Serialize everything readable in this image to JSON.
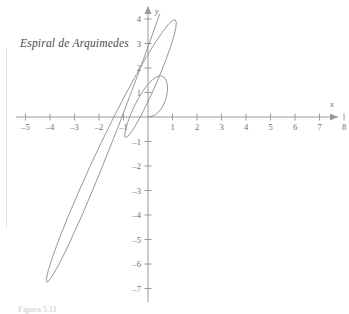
{
  "figure": {
    "title": "Espiral de Arquimedes",
    "caption": "Figura 5.11",
    "background_color": "#ffffff",
    "curve_color": "#8c8c8c",
    "axis_color": "#9a9a9a",
    "label_color": "#6d6d6d",
    "title_color": "#4a4a4a"
  },
  "chart_data": {
    "type": "line",
    "title": "Espiral de Arquimedes",
    "xlabel": "x",
    "ylabel": "y",
    "xlim": [
      -5,
      8
    ],
    "ylim": [
      -7,
      4
    ],
    "grid": false,
    "legend": null,
    "equation": "r = theta",
    "theta_range": [
      0,
      6.283185307179586
    ],
    "x_ticks": [
      -5,
      -4,
      -3,
      -2,
      -1,
      1,
      2,
      3,
      4,
      5,
      6,
      7,
      8
    ],
    "x_tick_labels": [
      "–5",
      "–4",
      "–3",
      "–2",
      "–1",
      "1",
      "2",
      "3",
      "4",
      "5",
      "6",
      "7",
      "8"
    ],
    "y_ticks": [
      4,
      3,
      2,
      1,
      -1,
      -2,
      -3,
      -4,
      -5,
      -6,
      -7
    ],
    "y_tick_labels": [
      "4",
      "3",
      "2",
      "1",
      "–1",
      "–2",
      "–3",
      "–4",
      "–5",
      "–6",
      "–7"
    ],
    "origin_px": [
      148,
      117
    ],
    "unit_px": 24.5,
    "series": [
      {
        "name": "r = theta",
        "points": [
          [
            0.0,
            0.0
          ],
          [
            0.1545,
            0.0245
          ],
          [
            0.3033,
            0.0969
          ],
          [
            0.4405,
            0.2139
          ],
          [
            0.5611,
            0.3696
          ],
          [
            0.6604,
            0.5554
          ],
          [
            0.7346,
            0.7604
          ],
          [
            0.7808,
            0.9721
          ],
          [
            0.797,
            1.1771
          ],
          [
            0.7822,
            1.3619
          ],
          [
            0.7365,
            1.5136
          ],
          [
            0.6612,
            1.6209
          ],
          [
            0.5586,
            1.6748
          ],
          [
            0.432,
            1.669
          ],
          [
            0.2859,
            1.6007
          ],
          [
            0.1253,
            1.4707
          ],
          [
            -0.0438,
            1.2836
          ],
          [
            -0.215,
            1.0478
          ],
          [
            -0.3817,
            0.7749
          ],
          [
            -0.5375,
            0.4795
          ],
          [
            -0.6758,
            0.178
          ],
          [
            -0.7909,
            -0.1121
          ],
          [
            -0.8775,
            -0.3731
          ],
          [
            -0.9312,
            -0.5885
          ],
          [
            -0.9489,
            -0.7432
          ],
          [
            -0.9285,
            -0.8247
          ],
          [
            -0.8694,
            -0.8236
          ],
          [
            -0.7724,
            -0.7343
          ],
          [
            -0.6401,
            -0.5556
          ],
          [
            -0.4766,
            -0.2908
          ],
          [
            -0.2875,
            0.0521
          ],
          [
            -0.08,
            0.461
          ],
          [
            0.1379,
            0.9204
          ],
          [
            0.3572,
            1.4124
          ],
          [
            0.5683,
            1.9166
          ],
          [
            0.7611,
            2.4112
          ],
          [
            0.9255,
            2.8737
          ],
          [
            1.0517,
            3.2812
          ],
          [
            1.1308,
            3.6119
          ],
          [
            1.1551,
            3.8451
          ],
          [
            1.1182,
            3.9628
          ],
          [
            1.0157,
            3.9504
          ],
          [
            0.8452,
            3.7971
          ],
          [
            0.6069,
            3.4971
          ],
          [
            0.3034,
            3.0497
          ],
          [
            -0.0597,
            2.46
          ],
          [
            -0.4737,
            1.7388
          ],
          [
            -0.9273,
            0.9027
          ],
          [
            -1.4069,
            -0.0267
          ],
          [
            -1.8971,
            -1.0217
          ],
          [
            -2.381,
            -2.0495
          ],
          [
            -2.8406,
            -3.0731
          ],
          [
            -3.2577,
            -4.0521
          ],
          [
            -3.6141,
            -4.9434
          ],
          [
            -3.8924,
            -5.7025
          ],
          [
            -4.0769,
            -6.2848
          ],
          [
            -4.1539,
            -6.6474
          ],
          [
            -4.1125,
            -6.7501
          ],
          [
            -3.9453,
            -6.5575
          ],
          [
            -3.6485,
            -6.0404
          ],
          [
            -3.2227,
            -5.1785
          ],
          [
            -2.6733,
            -3.9615
          ],
          [
            -2.0104,
            -2.3916
          ],
          [
            -1.2493,
            -0.4845
          ],
          [
            -0.4101,
            1.7297
          ],
          [
            0.4823,
            4.2091
          ],
          [
            1.3986,
            6.9007
          ],
          [
            2.3063,
            9.7418
          ]
        ]
      }
    ],
    "key_points": {
      "inner_loop_top": [
        -1.0,
        1.85
      ],
      "inner_loop_right": [
        0.6,
        0.7
      ],
      "x_axis_crossing_left": [
        -3.15,
        0
      ],
      "lowest_point": [
        0.5,
        -4.75
      ],
      "x_axis_crossing_right": [
        6.3,
        0
      ]
    }
  },
  "axes": {
    "x_axis_label": "x",
    "y_axis_label": "y",
    "x_arrow": "right-arrow",
    "y_arrow": "up-arrow"
  }
}
